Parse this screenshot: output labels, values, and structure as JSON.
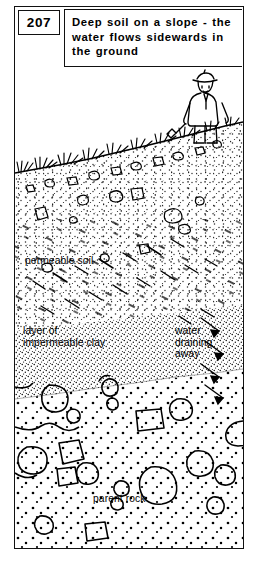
{
  "figure": {
    "number": "207",
    "title": "Deep soil on a slope - the water flows sidewards in the ground"
  },
  "illustration": {
    "labels": {
      "permeable_soil": "permeable soil",
      "impermeable_clay": "layer of\nimpermeable clay",
      "water_draining": "water\ndraining\naway",
      "parent_rock": "parent rock"
    },
    "scene": {
      "figure_person": "farmer-with-hoe",
      "surface": "grass-tufts-on-slope",
      "layers": [
        "permeable soil",
        "layer of impermeable clay",
        "parent rock"
      ],
      "water_flow": "vertical-percolation-then-lateral-downslope",
      "arrows": "water-draining-away-arrows"
    },
    "colors": {
      "ink": "#000000",
      "background": "#ffffff"
    }
  }
}
